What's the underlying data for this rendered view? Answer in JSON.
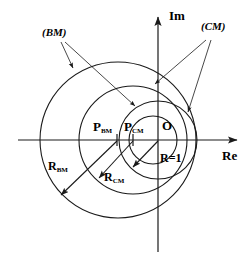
{
  "figure": {
    "background_color": "#ffffff",
    "stroke_color": "#1a1a1a"
  },
  "axes": {
    "imaginary_label": "Im",
    "real_label": "Re",
    "origin_label": "O"
  },
  "annotations": {
    "bm_set_label": "(BM)",
    "cm_set_label": "(CM)",
    "p_bm_label": "P",
    "p_bm_sub": "BM",
    "p_cm_label": "P",
    "p_cm_sub": "CM",
    "r_bm_label": "R",
    "r_bm_sub": "BM",
    "r_cm_label": "R",
    "r_cm_sub": "CM",
    "unit_radius_label": "R=1"
  },
  "chart_data": {
    "type": "diagram",
    "xlabel": "Re",
    "ylabel": "Im",
    "origin": {
      "x": 158,
      "y": 140,
      "label": "O"
    },
    "circles": [
      {
        "name": "BM",
        "center_x": 118,
        "center_y": 140,
        "radius": 78,
        "label": "(BM)",
        "center_label": "P_BM",
        "radius_label": "R_BM"
      },
      {
        "name": "CM",
        "center_x": 133,
        "center_y": 140,
        "radius": 54,
        "label": "(CM)",
        "center_label": "P_CM",
        "radius_label": "R_CM"
      },
      {
        "name": "unit",
        "center_x": 158,
        "center_y": 140,
        "radius": 39,
        "label": "R=1",
        "center_label": "O",
        "radius_label": "R=1"
      },
      {
        "name": "inner",
        "center_x": 153,
        "center_y": 140,
        "radius": 24,
        "label": "",
        "center_label": "",
        "radius_label": ""
      }
    ],
    "axis_ranges": {
      "x": [
        18,
        240
      ],
      "y": [
        14,
        252
      ]
    },
    "grid": false,
    "legend": "none"
  }
}
